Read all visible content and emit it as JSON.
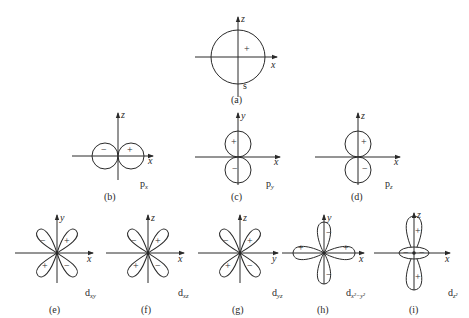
{
  "figure": {
    "colors": {
      "line": "#2a2a2a",
      "background": "#ffffff"
    },
    "panels": [
      {
        "id": "a",
        "caption": "(a)",
        "orbital": "s",
        "orbital_sub": "",
        "axes": [
          "z",
          "x"
        ],
        "signs": [
          "+"
        ]
      },
      {
        "id": "b",
        "caption": "(b)",
        "orbital": "p",
        "orbital_sub": "x",
        "axes": [
          "z",
          "x"
        ],
        "signs": [
          "−",
          "+"
        ]
      },
      {
        "id": "c",
        "caption": "(c)",
        "orbital": "p",
        "orbital_sub": "y",
        "axes": [
          "y",
          "x"
        ],
        "signs": [
          "+",
          "−"
        ]
      },
      {
        "id": "d",
        "caption": "(d)",
        "orbital": "p",
        "orbital_sub": "z",
        "axes": [
          "z",
          "x"
        ],
        "signs": [
          "+",
          "−"
        ]
      },
      {
        "id": "e",
        "caption": "(e)",
        "orbital": "d",
        "orbital_sub": "xy",
        "axes": [
          "y",
          "x"
        ],
        "signs": [
          "−",
          "+",
          "+",
          "−"
        ]
      },
      {
        "id": "f",
        "caption": "(f)",
        "orbital": "d",
        "orbital_sub": "xz",
        "axes": [
          "z",
          "x"
        ],
        "signs": [
          "−",
          "+",
          "+",
          "−"
        ]
      },
      {
        "id": "g",
        "caption": "(g)",
        "orbital": "d",
        "orbital_sub": "yz",
        "axes": [
          "z",
          "y"
        ],
        "signs": [
          "−",
          "+",
          "+",
          "−"
        ]
      },
      {
        "id": "h",
        "caption": "(h)",
        "orbital": "d",
        "orbital_sub": "x²−y²",
        "axes": [
          "y",
          "x"
        ],
        "signs": [
          "−",
          "+",
          "+",
          "−"
        ]
      },
      {
        "id": "i",
        "caption": "(i)",
        "orbital": "d",
        "orbital_sub": "z²",
        "axes": [
          "z",
          "x"
        ],
        "signs": [
          "+",
          "−",
          "−",
          "+"
        ]
      }
    ]
  }
}
